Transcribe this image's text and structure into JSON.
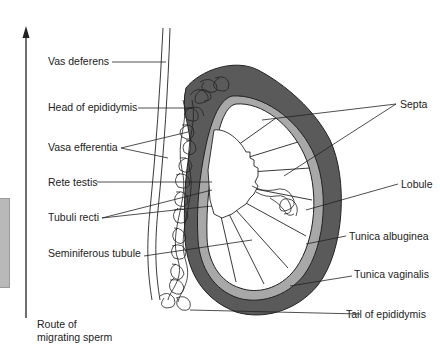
{
  "diagram": {
    "route_label_line1": "Route of",
    "route_label_line2": "migrating sperm",
    "labels_left": [
      {
        "text": "Vas deferens"
      },
      {
        "text": "Head of epididymis"
      },
      {
        "text": "Vasa efferentia"
      },
      {
        "text": "Rete testis"
      },
      {
        "text": "Tubuli recti"
      },
      {
        "text": "Seminiferous tubule"
      }
    ],
    "labels_right": [
      {
        "text": "Septa"
      },
      {
        "text": "Lobule"
      },
      {
        "text": "Tunica albuginea"
      },
      {
        "text": "Tunica vaginalis"
      },
      {
        "text": "Tail of epididymis"
      }
    ],
    "colors": {
      "tunica_vaginalis": "#5a5a5a",
      "tunica_albuginea": "#a8a8a8",
      "line": "#222222",
      "side_tab": "#b9b9b9"
    }
  }
}
